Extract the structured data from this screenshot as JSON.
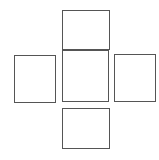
{
  "diagram": {
    "type": "cube-net-cross",
    "stroke_color": "#555555",
    "background": "#ffffff",
    "faces": [
      {
        "name": "top",
        "x": 62,
        "y": 10,
        "w": 47,
        "h": 39
      },
      {
        "name": "left",
        "x": 14,
        "y": 55,
        "w": 41,
        "h": 47
      },
      {
        "name": "center",
        "x": 62,
        "y": 50,
        "w": 46,
        "h": 51
      },
      {
        "name": "right",
        "x": 114,
        "y": 54,
        "w": 41,
        "h": 47
      },
      {
        "name": "bottom",
        "x": 62,
        "y": 108,
        "w": 47,
        "h": 40
      }
    ]
  }
}
